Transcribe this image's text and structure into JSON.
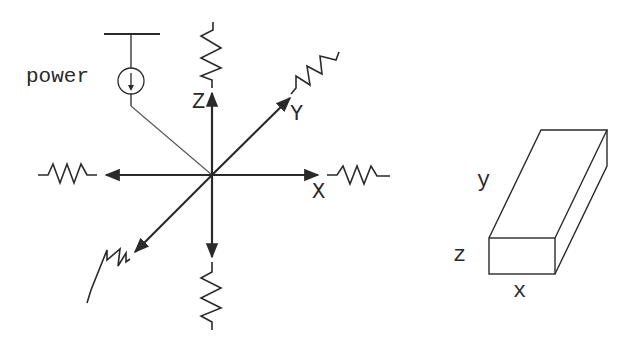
{
  "diagram": {
    "title": "",
    "left_figure": {
      "power_label": "power",
      "axis_labels": {
        "x": "X",
        "y": "Y",
        "z": "Z"
      },
      "springs": [
        "+X",
        "-X",
        "+Y",
        "-Y",
        "+Z",
        "-Z"
      ],
      "power_source_icon": "current-source-icon"
    },
    "right_figure": {
      "dimension_labels": {
        "x": "x",
        "y": "y",
        "z": "z"
      },
      "shape": "rectangular-box"
    },
    "colors": {
      "stroke": "#2a2a2a",
      "thin_stroke": "#555555",
      "background": "#ffffff"
    }
  }
}
